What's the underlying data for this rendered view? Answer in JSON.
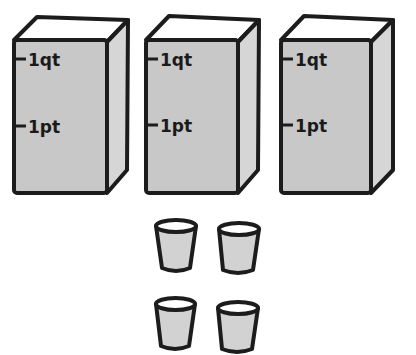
{
  "colors": {
    "outline": "#1c1c1c",
    "front_face": "#c8c8c8",
    "side_face": "#d6d6d6",
    "top_face": "#ffffff",
    "cup_body": "#d2d2d2",
    "cup_rim": "#ffffff",
    "background": "#ffffff"
  },
  "cartons": [
    {
      "name": "carton-1",
      "marks": [
        {
          "label": "1qt"
        },
        {
          "label": "1pt"
        }
      ]
    },
    {
      "name": "carton-2",
      "marks": [
        {
          "label": "1qt"
        },
        {
          "label": "1pt"
        }
      ]
    },
    {
      "name": "carton-3",
      "marks": [
        {
          "label": "1qt"
        },
        {
          "label": "1pt"
        }
      ]
    }
  ],
  "cups": {
    "count": 4,
    "rows": 2,
    "columns": 2
  }
}
